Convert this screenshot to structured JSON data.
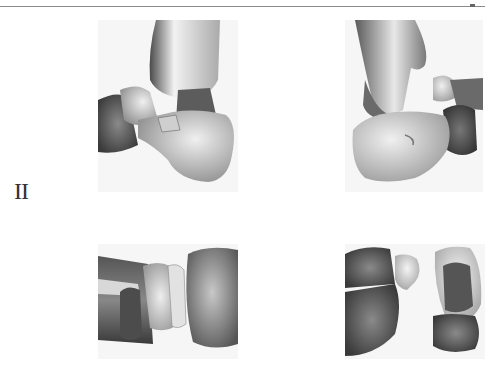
{
  "page": {
    "section_label": "II",
    "layout": "2x2 figure grid"
  },
  "figure": {
    "panels": [
      {
        "position": "top-left",
        "view": "lateral ankle view",
        "icon": "bone-render-image"
      },
      {
        "position": "top-right",
        "view": "medial ankle view",
        "icon": "bone-render-image"
      },
      {
        "position": "bottom-left",
        "view": "dorsal foot view",
        "icon": "bone-render-image"
      },
      {
        "position": "bottom-right",
        "view": "posterior foot view",
        "icon": "bone-render-image"
      }
    ]
  },
  "colors": {
    "bone_light": "#e6e6e6",
    "bone_mid": "#9a9a9a",
    "bone_dark": "#555555",
    "rule": "#8a8a8a",
    "label": "#333333"
  }
}
